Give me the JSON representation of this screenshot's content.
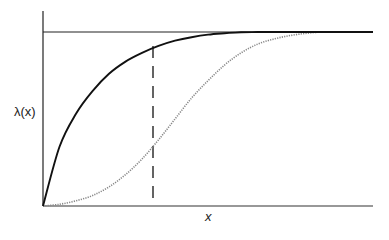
{
  "chart_data": {
    "type": "line",
    "title": "",
    "xlabel": "x",
    "ylabel": "λ(x)",
    "xlim": [
      0,
      1
    ],
    "ylim": [
      0,
      1
    ],
    "grid": false,
    "legend": null,
    "x": [
      0.0,
      0.05,
      0.1,
      0.15,
      0.2,
      0.25,
      0.3,
      0.35,
      0.4,
      0.45,
      0.5,
      0.55,
      0.6,
      0.65,
      0.7,
      0.75,
      0.8,
      0.85,
      0.9,
      0.95,
      1.0
    ],
    "series": [
      {
        "name": "solid-curve",
        "style": "solid",
        "color": "#111111",
        "values": [
          0.0,
          0.34,
          0.53,
          0.66,
          0.76,
          0.83,
          0.88,
          0.92,
          0.95,
          0.97,
          0.985,
          0.993,
          0.998,
          1.0,
          1.0,
          1.0,
          1.0,
          1.0,
          1.0,
          1.0,
          1.0
        ]
      },
      {
        "name": "dotted-curve",
        "style": "dotted",
        "color": "#777777",
        "values": [
          0.0,
          0.01,
          0.03,
          0.06,
          0.11,
          0.18,
          0.27,
          0.38,
          0.5,
          0.62,
          0.72,
          0.81,
          0.88,
          0.93,
          0.96,
          0.98,
          0.993,
          1.0,
          1.0,
          1.0,
          1.0
        ]
      }
    ],
    "annotations": [
      {
        "type": "hline",
        "y": 1.0,
        "style": "solid",
        "label": "asymptote"
      },
      {
        "type": "vline",
        "x": 0.33,
        "style": "dashed",
        "label": "reference-x"
      }
    ]
  },
  "labels": {
    "y": "λ(x)",
    "x": "x"
  }
}
